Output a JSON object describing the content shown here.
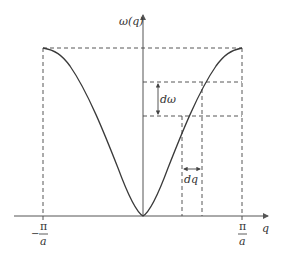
{
  "diagram": {
    "y_axis_label": "ω(q)",
    "x_axis_label": "q",
    "left_tick": {
      "sign": "−",
      "numerator": "π",
      "denominator": "a"
    },
    "right_tick": {
      "numerator": "π",
      "denominator": "a"
    },
    "d_omega_label": "dω",
    "d_q_label": "dq",
    "colors": {
      "curve": "#3a3a3a",
      "axes": "#555555",
      "dashes": "#444444",
      "background": "#ffffff"
    }
  }
}
